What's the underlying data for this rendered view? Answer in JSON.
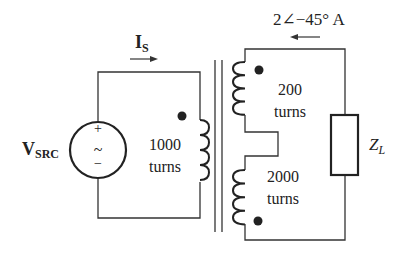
{
  "diagram": {
    "type": "transformer-circuit",
    "colors": {
      "line": "#333333",
      "text": "#222222",
      "background": "#ffffff"
    },
    "source": {
      "label_main": "V",
      "label_sub": "SRC",
      "plus": "+",
      "minus": "−",
      "symbol": "~"
    },
    "primary_current": {
      "label_main": "I",
      "label_sub": "S",
      "direction": "right"
    },
    "primary_winding": {
      "turns_value": "1000",
      "turns_unit": "turns"
    },
    "secondary_top_winding": {
      "turns_value": "200",
      "turns_unit": "turns"
    },
    "secondary_bottom_winding": {
      "turns_value": "2000",
      "turns_unit": "turns"
    },
    "load_current": {
      "label": "2∠−45° A",
      "direction": "left"
    },
    "load": {
      "label_main": "Z",
      "label_sub": "L"
    }
  }
}
